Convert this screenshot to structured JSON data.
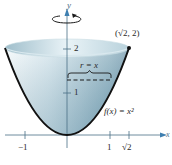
{
  "diagram": {
    "axes": {
      "x_label": "x",
      "y_label": "y",
      "x_ticks": [
        "−1",
        "1",
        "√2"
      ],
      "y_ticks": [
        "1",
        "2"
      ]
    },
    "labels": {
      "point": "(√2, 2)",
      "function": "f(x) = x²",
      "radius": "r = x"
    },
    "rotation_indicator": "rotation-arrow about y-axis",
    "colors": {
      "solid_fill_light": "#e6f1f5",
      "solid_fill_dark": "#7fa7b8",
      "curve": "#111111",
      "axis": "#4a6f86",
      "axis_arrow": "#3f7fb0",
      "text": "#2a2a2a"
    }
  }
}
